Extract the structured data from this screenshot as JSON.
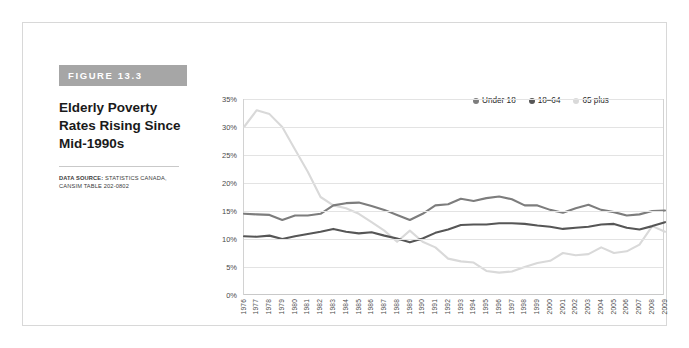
{
  "figure": {
    "banner_label": "FIGURE 13.3",
    "title": "Elderly Poverty Rates Rising Since Mid-1990s",
    "data_source_label": "DATA SOURCE:",
    "data_source_text": " STATISTICS CANADA, CANSIM TABLE 202-0802"
  },
  "colors": {
    "banner_background": "#a6a6a6",
    "under18": "#7d7d7d",
    "age18to64": "#565656",
    "age65plus": "#d9d9d9",
    "gridline": "#e3e3e3",
    "frame": "#d8d8d8"
  },
  "chart_data": {
    "type": "line",
    "title": "Elderly Poverty Rates Rising Since Mid-1990s",
    "xlabel": "",
    "ylabel": "",
    "ylim": [
      0,
      35
    ],
    "ytick_labels": [
      "0%",
      "5%",
      "10%",
      "15%",
      "20%",
      "25%",
      "30%",
      "35%"
    ],
    "ytick_values": [
      0,
      5,
      10,
      15,
      20,
      25,
      30,
      35
    ],
    "grid": true,
    "legend_position": "top-right",
    "x": [
      1976,
      1977,
      1978,
      1979,
      1980,
      1981,
      1982,
      1983,
      1984,
      1985,
      1986,
      1987,
      1988,
      1989,
      1990,
      1991,
      1992,
      1993,
      1994,
      1995,
      1996,
      1997,
      1998,
      1999,
      2000,
      2001,
      2002,
      2003,
      2004,
      2005,
      2006,
      2007,
      2008,
      2009
    ],
    "categories": [
      "1976",
      "1977",
      "1978",
      "1979",
      "1980",
      "1981",
      "1982",
      "1983",
      "1984",
      "1985",
      "1986",
      "1987",
      "1988",
      "1989",
      "1990",
      "1991",
      "1992",
      "1993",
      "1994",
      "1995",
      "1996",
      "1997",
      "1998",
      "1999",
      "2000",
      "2001",
      "2002",
      "2003",
      "2004",
      "2005",
      "2006",
      "2007",
      "2008",
      "2009"
    ],
    "series": [
      {
        "name": "Under 18",
        "color": "#7d7d7d",
        "values": [
          14.5,
          14.4,
          14.3,
          13.4,
          14.2,
          14.2,
          14.5,
          16.0,
          16.4,
          16.5,
          15.9,
          15.2,
          14.3,
          13.4,
          14.5,
          16.0,
          16.2,
          17.2,
          16.8,
          17.3,
          17.6,
          17.1,
          16.0,
          16.0,
          15.2,
          14.7,
          15.5,
          16.1,
          15.2,
          14.8,
          14.2,
          14.4,
          15.0,
          15.1
        ],
        "description": "Poverty rate for children under 18"
      },
      {
        "name": "18–64",
        "color": "#565656",
        "values": [
          10.5,
          10.4,
          10.6,
          10.0,
          10.5,
          10.9,
          11.3,
          11.8,
          11.3,
          11.0,
          11.2,
          10.6,
          10.1,
          9.4,
          10.1,
          11.1,
          11.7,
          12.5,
          12.6,
          12.6,
          12.8,
          12.8,
          12.7,
          12.4,
          12.2,
          11.8,
          12.0,
          12.2,
          12.6,
          12.7,
          12.0,
          11.7,
          12.3,
          13.0
        ],
        "description": "Poverty rate for working-age adults 18 to 64"
      },
      {
        "name": "65 plus",
        "color": "#d9d9d9",
        "values": [
          30.0,
          33.0,
          32.3,
          30.0,
          26.0,
          22.0,
          17.5,
          16.0,
          15.5,
          14.5,
          13.0,
          11.5,
          9.5,
          11.5,
          9.5,
          8.5,
          6.5,
          6.0,
          5.8,
          4.3,
          4.0,
          4.2,
          5.0,
          5.7,
          6.1,
          7.5,
          7.1,
          7.3,
          8.5,
          7.5,
          7.8,
          9.0,
          12.3,
          11.3
        ],
        "description": "Poverty rate for seniors 65 and over"
      }
    ]
  },
  "legend": {
    "items": [
      {
        "label": "Under 18",
        "color": "#7d7d7d"
      },
      {
        "label": "18–64",
        "color": "#565656"
      },
      {
        "label": "65 plus",
        "color": "#d9d9d9"
      }
    ]
  }
}
